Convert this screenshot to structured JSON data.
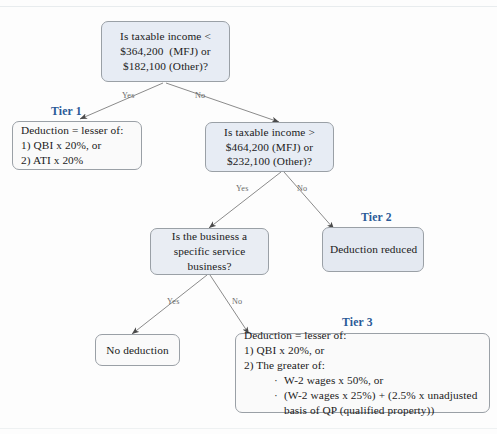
{
  "diagram": {
    "title_present": false,
    "accent_color": "#2a5a97",
    "node_fill_decision": "#e7ecf4",
    "node_fill_outcome": "#fafafa",
    "border_color": "#9aa0a6"
  },
  "nodes": {
    "q1": {
      "name": "taxable-income-threshold-lower",
      "line1": "Is taxable income <",
      "line2": "$364,200  (MFJ) or",
      "line3": "$182,100 (Other)?"
    },
    "q2": {
      "name": "taxable-income-threshold-upper",
      "line1": "Is taxable income >",
      "line2": "$464,200 (MFJ) or",
      "line3": "$232,100 (Other)?"
    },
    "q3": {
      "name": "specific-service-business",
      "line1": "Is the business a",
      "line2": "specific service",
      "line3": "business?"
    },
    "tier1": {
      "label": "Tier 1",
      "line1": "Deduction = lesser of:",
      "line2": "1) QBI x 20%, or",
      "line3": "2) ATI x 20%"
    },
    "tier2": {
      "label": "Tier 2",
      "line1": "Deduction reduced"
    },
    "tier3": {
      "label": "Tier 3",
      "line1": "Deduction = lesser of:",
      "line2": "1) QBI x 20%, or",
      "line3": "2) The greater of:",
      "bullet1": "W-2 wages x 50%, or",
      "bullet2": "(W-2 wages x 25%) + (2.5% x unadjusted",
      "bullet2_cont": "basis of QP (qualified property))",
      "bullet_glyph": "·"
    },
    "nodeduction": {
      "line1": "No deduction"
    }
  },
  "branches": {
    "q1_yes": "Yes",
    "q1_no": "No",
    "q2_yes": "Yes",
    "q2_no": "No",
    "q3_yes": "Yes",
    "q3_no": "No"
  }
}
